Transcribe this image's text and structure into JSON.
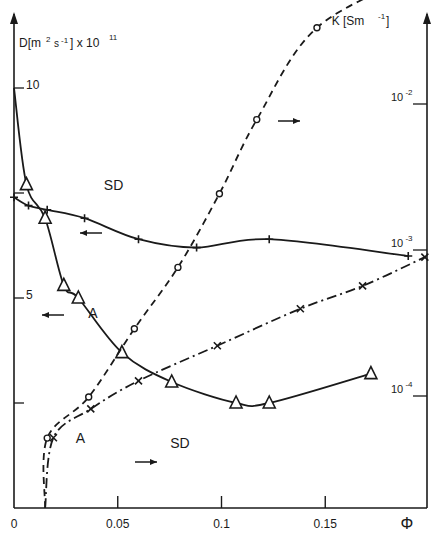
{
  "chart_data": {
    "type": "line",
    "title": "",
    "xlabel": "Φ",
    "ylabel_left": "D [m² s⁻¹] × 10¹¹",
    "ylabel_right": "K [S m⁻¹]",
    "xlim": [
      0,
      0.2
    ],
    "ylim_left": [
      0,
      10
    ],
    "ylim_right": [
      5e-05,
      0.03
    ],
    "yscale_right": "log",
    "grid": false,
    "x_ticks": [
      {
        "value": 0,
        "label": "0"
      },
      {
        "value": 0.05,
        "label": "0.05"
      },
      {
        "value": 0.1,
        "label": "0.1"
      },
      {
        "value": 0.15,
        "label": "0.15"
      }
    ],
    "x_axis_end_label": "Φ",
    "y_left_ticks": [
      {
        "value": 10,
        "label": "10"
      },
      {
        "value": 7.5,
        "label": ""
      },
      {
        "value": 5,
        "label": "5"
      },
      {
        "value": 2.5,
        "label": ""
      }
    ],
    "y_right_ticks": [
      {
        "exp": -2,
        "label": "10",
        "sup": "-2"
      },
      {
        "exp": -3,
        "label": "10",
        "sup": "-3"
      },
      {
        "exp": -4,
        "label": "10",
        "sup": "-4"
      }
    ],
    "left_axis_title": {
      "main": "D",
      "unit": "[m",
      "unit_sup": "2",
      "unit2": "s",
      "unit2_sup": "-1",
      "unit_end": "]",
      "factor": "x 10",
      "factor_sup": "11"
    },
    "right_axis_title": {
      "main": "K [Sm",
      "sup": "-1",
      "end": "]"
    },
    "series": [
      {
        "name": "A (D)",
        "label": "A",
        "axis": "left",
        "marker": "triangle",
        "line": "solid",
        "curve_start": {
          "x": 0,
          "y": 10
        },
        "x": [
          0.006,
          0.015,
          0.024,
          0.031,
          0.052,
          0.076,
          0.107,
          0.123,
          0.172
        ],
        "y": [
          7.7,
          6.9,
          5.3,
          5.0,
          3.7,
          3.0,
          2.5,
          2.5,
          3.2
        ]
      },
      {
        "name": "SD (D)",
        "label": "SD",
        "axis": "left",
        "marker": "plus",
        "line": "solid",
        "x": [
          0.0,
          0.007,
          0.016,
          0.034,
          0.06,
          0.088,
          0.123,
          0.19
        ],
        "y": [
          7.4,
          7.2,
          7.1,
          6.9,
          6.4,
          6.2,
          6.4,
          6.0
        ]
      },
      {
        "name": "A (K)",
        "label": "A",
        "axis": "right",
        "marker": "circle",
        "line": "dashed",
        "x": [
          0.016,
          0.036,
          0.058,
          0.079,
          0.099,
          0.117,
          0.146,
          0.196
        ],
        "y": [
          5.15e-05,
          9.85e-05,
          0.000289,
          0.00076,
          0.00243,
          0.00782,
          0.0333,
          0.0788
        ]
      },
      {
        "name": "SD (K)",
        "label": "SD",
        "axis": "right",
        "marker": "cross",
        "line": "dashdot",
        "x": [
          0.019,
          0.037,
          0.06,
          0.098,
          0.138,
          0.168,
          0.198
        ],
        "y": [
          5.18e-05,
          8.16e-05,
          0.000127,
          0.000221,
          0.000396,
          0.000568,
          0.000894
        ]
      }
    ],
    "annotations": [
      {
        "text": "SD",
        "x": 0.048,
        "y_px": 190,
        "series": "SD (D)"
      },
      {
        "text": "A",
        "x": 0.038,
        "y_px": 318,
        "series": "A (D)"
      },
      {
        "text": "A",
        "x": 0.032,
        "y_px": 443,
        "series": "A (K)"
      },
      {
        "text": "SD",
        "x": 0.08,
        "y_px": 448,
        "series": "SD (K)"
      }
    ],
    "arrows": [
      {
        "direction": "left",
        "x_px": 80,
        "y_px": 233,
        "series": "SD (D)"
      },
      {
        "direction": "left",
        "x_px": 42,
        "y_px": 315,
        "series": "A (D)"
      },
      {
        "direction": "right",
        "x_px": 135,
        "y_px": 462,
        "series": "SD (K)"
      },
      {
        "direction": "right",
        "x_px": 278,
        "y_px": 121,
        "series": "A (K)"
      }
    ]
  }
}
